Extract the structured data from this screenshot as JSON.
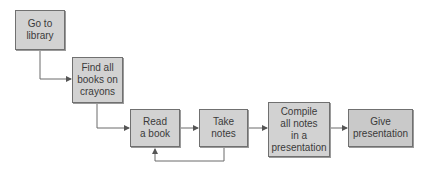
{
  "diagram": {
    "type": "flowchart",
    "nodes": [
      {
        "id": "n1",
        "label": "Go to\nlibrary"
      },
      {
        "id": "n2",
        "label": "Find all\nbooks on\ncrayons"
      },
      {
        "id": "n3",
        "label": "Read\na book"
      },
      {
        "id": "n4",
        "label": "Take\nnotes"
      },
      {
        "id": "n5",
        "label": "Compile\nall notes\nin a\npresentation"
      },
      {
        "id": "n6",
        "label": "Give\npresentation"
      }
    ],
    "edges": [
      {
        "from": "n1",
        "to": "n2"
      },
      {
        "from": "n2",
        "to": "n3"
      },
      {
        "from": "n3",
        "to": "n4"
      },
      {
        "from": "n4",
        "to": "n3",
        "note": "feedback loop"
      },
      {
        "from": "n4",
        "to": "n5"
      },
      {
        "from": "n5",
        "to": "n6"
      }
    ],
    "colors": {
      "box_fill": "#d2d2d2",
      "box_border": "#707070",
      "arrow": "#6a6a6a",
      "text": "#3a3a3a"
    }
  }
}
